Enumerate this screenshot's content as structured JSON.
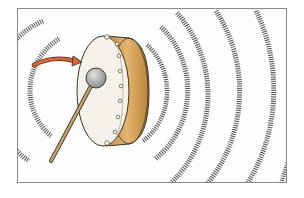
{
  "illustration": {
    "subject": "drum struck by mallet emitting sound waves",
    "caption": "Drum being struck by a mallet, sound waves radiating outward",
    "elements": {
      "drum": {
        "face_color": "#f4f2ea",
        "rim_color": "#d9a860",
        "rim_shadow": "#b07a34",
        "outline": "#3a3226",
        "tack_count": 7
      },
      "mallet": {
        "head_color": "#a9a9a9",
        "head_highlight": "#d8d8d8",
        "stick_color": "#c9a46a"
      },
      "arrow": {
        "color": "#e0642a",
        "direction": "toward drum"
      },
      "sound_waves": {
        "color": "#555555",
        "left_count": 2,
        "right_count": 4
      }
    }
  }
}
